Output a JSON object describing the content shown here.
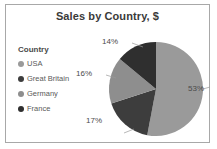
{
  "chart": {
    "title": "Sales by Country, $",
    "legend_title": "Country"
  },
  "chart_data": {
    "type": "pie",
    "title": "Sales by Country, $",
    "legend_title": "Country",
    "legend_position": "left",
    "categories": [
      "USA",
      "Great Britain",
      "Germany",
      "France"
    ],
    "values": [
      53,
      17,
      16,
      14
    ],
    "labels": [
      "53%",
      "17%",
      "16%",
      "14%"
    ],
    "value_unit": "%",
    "colors": [
      "#9a9a9a",
      "#3d3d3d",
      "#8e8e8e",
      "#2f2f2f"
    ],
    "start_angle": 0,
    "direction": "clockwise",
    "grid": false,
    "xlabel": "",
    "ylabel": ""
  },
  "style": {
    "border_color": "#a8a8a8",
    "title_color": "#3a3a3a",
    "label_color": "#4a4a4a",
    "background": "#ffffff"
  }
}
